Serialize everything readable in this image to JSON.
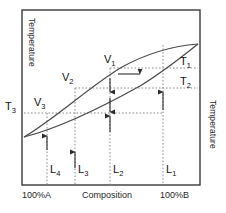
{
  "figure": {
    "type": "binary-phase-diagram"
  },
  "axes": {
    "left_axis_label": "Temperature",
    "right_axis_label": "Temperature",
    "x_axis_label": "Composition",
    "x_min_label": "100%A",
    "x_max_label": "100%B"
  },
  "temperature_lines": [
    {
      "name": "T1",
      "label": "T",
      "sub": "1",
      "y": 68
    },
    {
      "name": "T2",
      "label": "T",
      "sub": "2",
      "y": 88
    },
    {
      "name": "T3",
      "label": "T",
      "sub": "3",
      "y": 113
    }
  ],
  "vapour_points": [
    {
      "name": "V1",
      "label": "V",
      "sub": "1",
      "x": 110,
      "y": 73
    },
    {
      "name": "V2",
      "label": "V",
      "sub": "2",
      "x": 75,
      "y": 88
    },
    {
      "name": "V3",
      "label": "V",
      "sub": "3",
      "x": 47,
      "y": 113
    }
  ],
  "liquid_points": [
    {
      "name": "L1",
      "label": "L",
      "sub": "1",
      "x": 163,
      "y": 68
    },
    {
      "name": "L2",
      "label": "L",
      "sub": "2",
      "x": 110,
      "y": 88
    },
    {
      "name": "L3",
      "label": "L",
      "sub": "3",
      "x": 75,
      "y": 113
    },
    {
      "name": "L4",
      "label": "L",
      "sub": "4",
      "x": 47,
      "y": 124
    }
  ],
  "curves": {
    "liquidus_name": "liquidus-curve",
    "vapourus_name": "vapourus-curve"
  },
  "arrows": {
    "vertical_up_name": "vaporisation-arrow",
    "vertical_down_name": "condensation-arrow",
    "horizontal_name": "enrichment-arrow"
  }
}
